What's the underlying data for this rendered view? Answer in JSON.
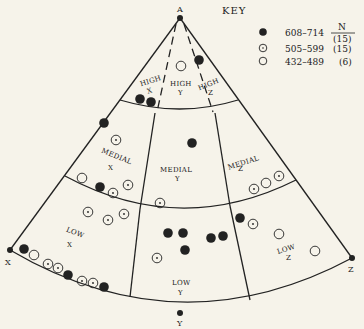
{
  "diagram": {
    "type": "sector-triangle",
    "vertices": {
      "apex": {
        "label": "A",
        "x": 180,
        "y": 18
      },
      "left": {
        "label": "X",
        "x": 10,
        "y": 250
      },
      "bottom": {
        "label": "Y",
        "x": 180,
        "y": 313
      },
      "right": {
        "label": "Z",
        "x": 352,
        "y": 258
      }
    },
    "colors": {
      "ink": "#222222",
      "paper": "#f6f3ea"
    }
  },
  "key": {
    "title": "KEY",
    "n_header": "N",
    "entries": [
      {
        "symbol": "filled",
        "range": "608–714",
        "n": "(15)"
      },
      {
        "symbol": "dotted",
        "range": "505–599",
        "n": "(15)"
      },
      {
        "symbol": "open",
        "range": "432–489",
        "n": "(6)"
      }
    ]
  },
  "regions": {
    "high_x": {
      "line1": "HIGH",
      "line2": "X"
    },
    "high_y": {
      "line1": "HIGH",
      "line2": "Y"
    },
    "high_z": {
      "line1": "HIGH",
      "line2": "Z"
    },
    "medial_x": {
      "line1": "MEDIAL",
      "line2": "X"
    },
    "medial_y": {
      "line1": "MEDIAL",
      "line2": "Y"
    },
    "medial_z": {
      "line1": "MEDIAL",
      "line2": "Z"
    },
    "low_x": {
      "line1": "LOW",
      "line2": "X"
    },
    "low_y": {
      "line1": "LOW",
      "line2": "Y"
    },
    "low_z": {
      "line1": "LOW",
      "line2": "Z"
    }
  },
  "points": [
    {
      "region": "high_y",
      "type": "open",
      "x": 181,
      "y": 66
    },
    {
      "region": "high_z",
      "type": "filled",
      "x": 199,
      "y": 60
    },
    {
      "region": "high_x",
      "type": "filled",
      "x": 140,
      "y": 99
    },
    {
      "region": "high_x",
      "type": "filled",
      "x": 151,
      "y": 102
    },
    {
      "region": "medial_x",
      "type": "filled",
      "x": 104,
      "y": 123
    },
    {
      "region": "medial_x",
      "type": "dotted",
      "x": 116,
      "y": 140
    },
    {
      "region": "medial_x",
      "type": "open",
      "x": 82,
      "y": 178
    },
    {
      "region": "medial_x",
      "type": "filled",
      "x": 100,
      "y": 187
    },
    {
      "region": "medial_x",
      "type": "dotted",
      "x": 113,
      "y": 193
    },
    {
      "region": "medial_x",
      "type": "dotted",
      "x": 128,
      "y": 185
    },
    {
      "region": "medial_y",
      "type": "filled",
      "x": 192,
      "y": 143
    },
    {
      "region": "medial_y",
      "type": "dotted",
      "x": 160,
      "y": 203
    },
    {
      "region": "medial_z",
      "type": "dotted",
      "x": 254,
      "y": 189
    },
    {
      "region": "medial_z",
      "type": "open",
      "x": 266,
      "y": 183
    },
    {
      "region": "medial_z",
      "type": "dotted",
      "x": 279,
      "y": 176
    },
    {
      "region": "low_x",
      "type": "dotted",
      "x": 88,
      "y": 212
    },
    {
      "region": "low_x",
      "type": "dotted",
      "x": 108,
      "y": 220
    },
    {
      "region": "low_x",
      "type": "dotted",
      "x": 124,
      "y": 214
    },
    {
      "region": "low_x",
      "type": "filled",
      "x": 24,
      "y": 249
    },
    {
      "region": "low_x",
      "type": "open",
      "x": 34,
      "y": 255
    },
    {
      "region": "low_x",
      "type": "dotted",
      "x": 48,
      "y": 264
    },
    {
      "region": "low_x",
      "type": "dotted",
      "x": 58,
      "y": 268
    },
    {
      "region": "low_x",
      "type": "filled",
      "x": 68,
      "y": 275
    },
    {
      "region": "low_x",
      "type": "dotted",
      "x": 82,
      "y": 281
    },
    {
      "region": "low_x",
      "type": "dotted",
      "x": 93,
      "y": 283
    },
    {
      "region": "low_x",
      "type": "filled",
      "x": 104,
      "y": 287
    },
    {
      "region": "low_y",
      "type": "filled",
      "x": 168,
      "y": 233
    },
    {
      "region": "low_y",
      "type": "filled",
      "x": 183,
      "y": 233
    },
    {
      "region": "low_y",
      "type": "filled",
      "x": 185,
      "y": 250
    },
    {
      "region": "low_y",
      "type": "filled",
      "x": 211,
      "y": 238
    },
    {
      "region": "low_y",
      "type": "filled",
      "x": 223,
      "y": 236
    },
    {
      "region": "low_y",
      "type": "dotted",
      "x": 157,
      "y": 258
    },
    {
      "region": "low_z",
      "type": "filled",
      "x": 240,
      "y": 218
    },
    {
      "region": "low_z",
      "type": "dotted",
      "x": 253,
      "y": 224
    },
    {
      "region": "low_z",
      "type": "open",
      "x": 279,
      "y": 234
    },
    {
      "region": "low_z",
      "type": "open",
      "x": 315,
      "y": 251
    }
  ]
}
